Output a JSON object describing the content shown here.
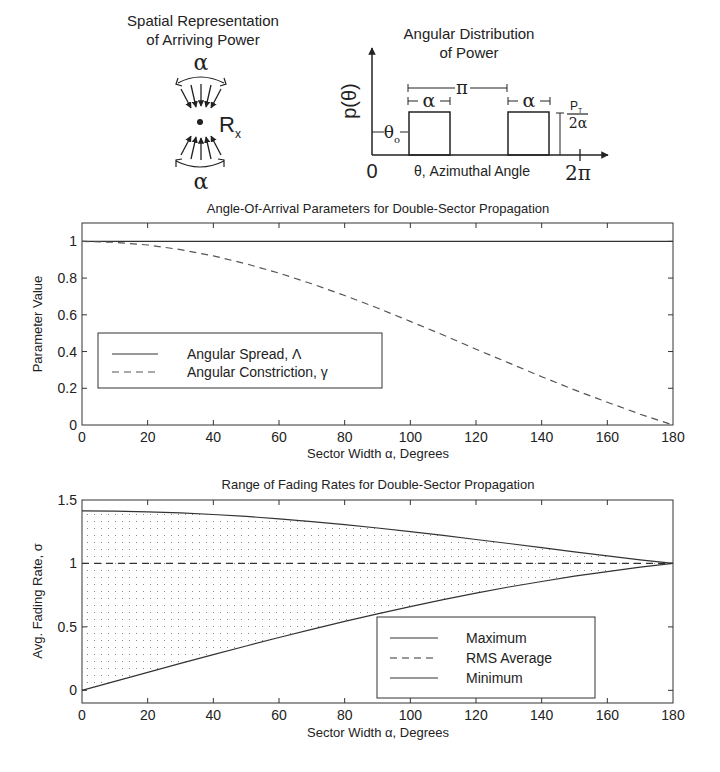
{
  "diagram_left": {
    "title_line1": "Spatial Representation",
    "title_line2": "of Arriving Power",
    "alpha_top": "α",
    "alpha_bottom": "α",
    "receiver_label": "R",
    "receiver_sub": "x"
  },
  "diagram_right": {
    "title_line1": "Angular Distribution",
    "title_line2": "of Power",
    "y_label": "p(θ)",
    "origin_label": "0",
    "end_label": "2π",
    "x_label": "θ, Azimuthal Angle",
    "pi_label": "π",
    "alpha1": "α",
    "alpha2": "α",
    "theta0": "θ",
    "theta0_sub": "o",
    "height_num": "P",
    "height_num_sub": "T",
    "height_den": "2α"
  },
  "chart_data": [
    {
      "type": "line",
      "title": "Angle-Of-Arrival Parameters for Double-Sector Propagation",
      "xlabel": "Sector Width α, Degrees",
      "ylabel": "Parameter Value",
      "xlim": [
        0,
        180
      ],
      "ylim": [
        0,
        1.1
      ],
      "xticks": [
        "0",
        "20",
        "40",
        "60",
        "80",
        "100",
        "120",
        "140",
        "160",
        "180"
      ],
      "yticks": [
        "0",
        "0.2",
        "0.4",
        "0.6",
        "0.8",
        "1"
      ],
      "grid": false,
      "legend_position": "left-middle",
      "x": [
        0,
        10,
        20,
        30,
        40,
        50,
        60,
        70,
        80,
        90,
        100,
        110,
        120,
        130,
        140,
        150,
        160,
        170,
        180
      ],
      "series": [
        {
          "name": "Angular Spread, Λ",
          "style": "solid",
          "values": [
            1,
            1,
            1,
            1,
            1,
            1,
            1,
            1,
            1,
            1,
            1,
            1,
            1,
            1,
            1,
            1,
            1,
            1,
            1
          ]
        },
        {
          "name": "Angular Constriction, γ",
          "style": "dashed",
          "values": [
            1,
            0.995,
            0.98,
            0.955,
            0.921,
            0.878,
            0.827,
            0.769,
            0.705,
            0.637,
            0.564,
            0.49,
            0.413,
            0.338,
            0.263,
            0.191,
            0.124,
            0.059,
            0
          ]
        }
      ]
    },
    {
      "type": "area",
      "title": "Range of Fading Rates for Double-Sector Propagation",
      "xlabel": "Sector Width α, Degrees",
      "ylabel": "Avg. Fading Rate, σ",
      "xlim": [
        0,
        180
      ],
      "ylim": [
        -0.1,
        1.5
      ],
      "xticks": [
        "0",
        "20",
        "40",
        "60",
        "80",
        "100",
        "120",
        "140",
        "160",
        "180"
      ],
      "yticks": [
        "0",
        "0.5",
        "1",
        "1.5"
      ],
      "grid": false,
      "legend_position": "lower-right",
      "fill": "dotted region between Maximum and Minimum",
      "x": [
        0,
        10,
        20,
        30,
        40,
        50,
        60,
        70,
        80,
        90,
        100,
        110,
        120,
        130,
        140,
        150,
        160,
        170,
        180
      ],
      "series": [
        {
          "name": "Maximum",
          "style": "solid",
          "values": [
            1.414,
            1.412,
            1.407,
            1.398,
            1.386,
            1.371,
            1.351,
            1.33,
            1.306,
            1.279,
            1.25,
            1.221,
            1.189,
            1.157,
            1.124,
            1.091,
            1.06,
            1.029,
            1.0
          ]
        },
        {
          "name": "RMS Average",
          "style": "dashed",
          "values": [
            1,
            1,
            1,
            1,
            1,
            1,
            1,
            1,
            1,
            1,
            1,
            1,
            1,
            1,
            1,
            1,
            1,
            1,
            1
          ]
        },
        {
          "name": "Minimum",
          "style": "solid",
          "values": [
            0,
            0.071,
            0.141,
            0.212,
            0.281,
            0.349,
            0.416,
            0.481,
            0.543,
            0.602,
            0.66,
            0.714,
            0.766,
            0.814,
            0.858,
            0.9,
            0.936,
            0.97,
            1.0
          ]
        }
      ]
    }
  ]
}
